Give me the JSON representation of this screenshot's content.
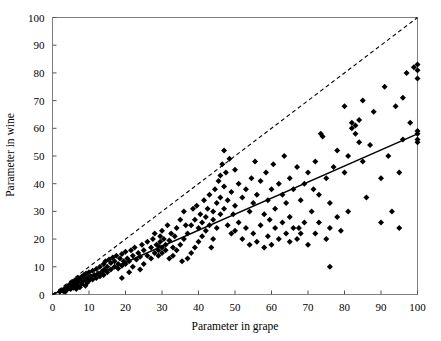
{
  "chart_data": {
    "type": "scatter",
    "title": "",
    "xlabel": "Parameter in grape",
    "ylabel": "Parameter in wine",
    "xlim": [
      0,
      100
    ],
    "ylim": [
      0,
      100
    ],
    "xticks": [
      0,
      10,
      20,
      30,
      40,
      50,
      60,
      70,
      80,
      90,
      100
    ],
    "yticks": [
      0,
      10,
      20,
      30,
      40,
      50,
      60,
      70,
      80,
      90,
      100
    ],
    "xtick_labels": [
      "0",
      "10",
      "20",
      "30",
      "40",
      "50",
      "60",
      "70",
      "80",
      "90",
      "100"
    ],
    "ytick_labels": [
      "0",
      "10",
      "20",
      "30",
      "40",
      "50",
      "60",
      "70",
      "80",
      "90",
      "100"
    ],
    "grid": false,
    "legend": "none",
    "marker": "diamond",
    "marker_color": "#000000",
    "frame_color": "#808080",
    "series": [
      {
        "name": "Observations",
        "marker": "diamond",
        "color": "#000000",
        "points": [
          [
            2.0,
            1.0
          ],
          [
            2.5,
            1.5
          ],
          [
            3.0,
            1.2
          ],
          [
            3.2,
            2.0
          ],
          [
            3.5,
            1.0
          ],
          [
            3.8,
            2.6
          ],
          [
            4.0,
            1.8
          ],
          [
            4.2,
            3.0
          ],
          [
            4.5,
            2.2
          ],
          [
            4.8,
            3.6
          ],
          [
            5.0,
            2.0
          ],
          [
            5.0,
            4.0
          ],
          [
            5.2,
            3.0
          ],
          [
            5.5,
            4.4
          ],
          [
            5.8,
            2.4
          ],
          [
            6.0,
            3.4
          ],
          [
            6.0,
            5.0
          ],
          [
            6.3,
            4.0
          ],
          [
            6.5,
            2.0
          ],
          [
            6.8,
            5.6
          ],
          [
            7.0,
            3.0
          ],
          [
            7.0,
            4.6
          ],
          [
            7.2,
            6.0
          ],
          [
            7.5,
            2.6
          ],
          [
            7.8,
            5.0
          ],
          [
            8.0,
            3.8
          ],
          [
            8.0,
            6.4
          ],
          [
            8.3,
            4.8
          ],
          [
            8.6,
            7.0
          ],
          [
            9.0,
            3.2
          ],
          [
            9.0,
            5.6
          ],
          [
            9.2,
            7.6
          ],
          [
            9.5,
            4.2
          ],
          [
            9.8,
            6.2
          ],
          [
            10.0,
            5.0
          ],
          [
            10.0,
            8.0
          ],
          [
            10.5,
            6.6
          ],
          [
            11.0,
            5.4
          ],
          [
            11.0,
            8.6
          ],
          [
            11.5,
            7.0
          ],
          [
            12.0,
            6.0
          ],
          [
            12.0,
            9.2
          ],
          [
            12.5,
            7.6
          ],
          [
            13.0,
            6.6
          ],
          [
            13.0,
            10.0
          ],
          [
            13.5,
            8.2
          ],
          [
            14.0,
            7.0
          ],
          [
            14.0,
            11.0
          ],
          [
            14.2,
            9.0
          ],
          [
            14.5,
            12.0
          ],
          [
            15.0,
            8.0
          ],
          [
            15.0,
            10.0
          ],
          [
            15.5,
            12.6
          ],
          [
            16.0,
            9.0
          ],
          [
            16.0,
            11.4
          ],
          [
            16.5,
            13.4
          ],
          [
            17.0,
            10.0
          ],
          [
            17.0,
            12.0
          ],
          [
            17.5,
            14.0
          ],
          [
            18.0,
            9.4
          ],
          [
            18.0,
            11.0
          ],
          [
            18.5,
            13.0
          ],
          [
            19.0,
            6.0
          ],
          [
            19.0,
            10.4
          ],
          [
            19.0,
            14.6
          ],
          [
            19.5,
            12.0
          ],
          [
            20.0,
            11.0
          ],
          [
            20.0,
            15.4
          ],
          [
            20.5,
            13.0
          ],
          [
            21.0,
            12.0
          ],
          [
            21.5,
            16.0
          ],
          [
            22.0,
            10.0
          ],
          [
            22.0,
            14.0
          ],
          [
            22.5,
            17.0
          ],
          [
            23.0,
            12.6
          ],
          [
            23.5,
            15.0
          ],
          [
            24.0,
            13.6
          ],
          [
            24.5,
            18.0
          ],
          [
            25.0,
            11.0
          ],
          [
            25.0,
            16.0
          ],
          [
            26.0,
            14.0
          ],
          [
            26.0,
            19.0
          ],
          [
            27.0,
            13.0
          ],
          [
            27.0,
            17.0
          ],
          [
            27.5,
            20.0
          ],
          [
            28.0,
            15.0
          ],
          [
            28.0,
            22.0
          ],
          [
            28.5,
            18.0
          ],
          [
            29.0,
            14.0
          ],
          [
            29.0,
            16.0
          ],
          [
            29.0,
            17.5
          ],
          [
            29.5,
            19.0
          ],
          [
            29.5,
            21.0
          ],
          [
            30.0,
            15.0
          ],
          [
            30.0,
            17.0
          ],
          [
            30.0,
            23.0
          ],
          [
            30.5,
            20.0
          ],
          [
            31.0,
            16.0
          ],
          [
            31.0,
            18.0
          ],
          [
            31.5,
            25.0
          ],
          [
            32.0,
            13.0
          ],
          [
            32.0,
            19.5
          ],
          [
            32.5,
            22.0
          ],
          [
            33.0,
            14.0
          ],
          [
            33.0,
            17.0
          ],
          [
            33.5,
            21.0
          ],
          [
            34.0,
            16.0
          ],
          [
            34.0,
            24.0
          ],
          [
            35.0,
            18.0
          ],
          [
            35.0,
            27.0
          ],
          [
            36.0,
            20.0
          ],
          [
            36.0,
            30.0
          ],
          [
            37.0,
            13.0
          ],
          [
            37.0,
            22.0
          ],
          [
            38.0,
            15.0
          ],
          [
            38.0,
            25.0
          ],
          [
            38.5,
            31.0
          ],
          [
            39.0,
            17.0
          ],
          [
            39.0,
            27.0
          ],
          [
            39.5,
            32.0
          ],
          [
            40.0,
            19.0
          ],
          [
            40.0,
            24.0
          ],
          [
            40.5,
            29.0
          ],
          [
            41.0,
            21.0
          ],
          [
            41.0,
            26.0
          ],
          [
            41.5,
            34.0
          ],
          [
            42.0,
            23.0
          ],
          [
            42.0,
            28.0
          ],
          [
            42.5,
            31.0
          ],
          [
            43.0,
            25.0
          ],
          [
            43.0,
            36.0
          ],
          [
            44.0,
            27.0
          ],
          [
            44.0,
            30.0
          ],
          [
            44.5,
            38.0
          ],
          [
            45.0,
            24.0
          ],
          [
            45.0,
            33.0
          ],
          [
            45.5,
            41.0
          ],
          [
            46.0,
            29.0
          ],
          [
            46.0,
            35.0
          ],
          [
            46.0,
            43.0
          ],
          [
            46.5,
            47.0
          ],
          [
            47.0,
            31.0
          ],
          [
            47.0,
            39.0
          ],
          [
            47.0,
            52.0
          ],
          [
            47.5,
            44.0
          ],
          [
            48.0,
            25.0
          ],
          [
            48.0,
            34.0
          ],
          [
            48.5,
            49.0
          ],
          [
            49.0,
            22.0
          ],
          [
            49.0,
            37.0
          ],
          [
            50.0,
            23.0
          ],
          [
            50.0,
            32.0
          ],
          [
            50.0,
            45.0
          ],
          [
            51.0,
            26.0
          ],
          [
            51.0,
            40.0
          ],
          [
            52.0,
            20.0
          ],
          [
            52.0,
            35.0
          ],
          [
            53.0,
            24.0
          ],
          [
            53.0,
            38.0
          ],
          [
            54.0,
            18.0
          ],
          [
            54.0,
            30.0
          ],
          [
            54.5,
            42.0
          ],
          [
            55.0,
            22.0
          ],
          [
            55.0,
            33.0
          ],
          [
            55.5,
            48.0
          ],
          [
            56.0,
            19.0
          ],
          [
            56.0,
            36.0
          ],
          [
            57.0,
            25.0
          ],
          [
            57.0,
            41.0
          ],
          [
            58.0,
            17.0
          ],
          [
            58.0,
            29.0
          ],
          [
            58.5,
            44.0
          ],
          [
            59.0,
            21.0
          ],
          [
            59.0,
            34.0
          ],
          [
            60.0,
            18.0
          ],
          [
            60.0,
            38.0
          ],
          [
            60.5,
            47.0
          ],
          [
            61.0,
            24.0
          ],
          [
            61.0,
            31.0
          ],
          [
            62.0,
            20.0
          ],
          [
            62.0,
            40.0
          ],
          [
            63.0,
            26.0
          ],
          [
            63.0,
            36.0
          ],
          [
            63.5,
            50.0
          ],
          [
            64.0,
            22.0
          ],
          [
            64.0,
            33.0
          ],
          [
            65.0,
            19.0
          ],
          [
            65.0,
            28.0
          ],
          [
            65.0,
            42.0
          ],
          [
            66.0,
            24.0
          ],
          [
            66.0,
            38.0
          ],
          [
            67.0,
            20.0
          ],
          [
            67.0,
            46.0
          ],
          [
            68.0,
            22.0
          ],
          [
            68.0,
            34.0
          ],
          [
            69.0,
            26.0
          ],
          [
            69.0,
            40.0
          ],
          [
            70.0,
            18.0
          ],
          [
            70.0,
            44.0
          ],
          [
            71.0,
            30.0
          ],
          [
            72.0,
            22.0
          ],
          [
            72.0,
            48.0
          ],
          [
            73.0,
            26.0
          ],
          [
            73.0,
            36.0
          ],
          [
            73.5,
            58.0
          ],
          [
            74.0,
            57.0
          ],
          [
            75.0,
            20.0
          ],
          [
            75.0,
            42.0
          ],
          [
            76.0,
            10.0
          ],
          [
            76.0,
            24.0
          ],
          [
            76.0,
            33.0
          ],
          [
            77.0,
            46.0
          ],
          [
            78.0,
            28.0
          ],
          [
            78.0,
            52.0
          ],
          [
            79.0,
            23.0
          ],
          [
            80.0,
            44.0
          ],
          [
            80.0,
            68.0
          ],
          [
            81.0,
            30.0
          ],
          [
            81.0,
            50.0
          ],
          [
            82.0,
            60.0
          ],
          [
            82.0,
            62.0
          ],
          [
            83.0,
            58.0
          ],
          [
            83.0,
            61.0
          ],
          [
            84.0,
            55.0
          ],
          [
            84.0,
            63.0
          ],
          [
            85.0,
            48.0
          ],
          [
            85.0,
            70.0
          ],
          [
            86.0,
            35.0
          ],
          [
            87.0,
            54.0
          ],
          [
            88.0,
            66.0
          ],
          [
            90.0,
            42.0
          ],
          [
            90.0,
            26.0
          ],
          [
            91.0,
            75.0
          ],
          [
            92.0,
            50.0
          ],
          [
            93.0,
            30.0
          ],
          [
            94.0,
            68.0
          ],
          [
            95.0,
            24.0
          ],
          [
            95.0,
            44.0
          ],
          [
            96.0,
            71.0
          ],
          [
            96.0,
            56.0
          ],
          [
            97.0,
            80.0
          ],
          [
            98.0,
            62.0
          ],
          [
            99.0,
            82.0
          ],
          [
            100.0,
            56.0
          ],
          [
            100.0,
            58.0
          ],
          [
            100.0,
            59.0
          ],
          [
            100.0,
            78.0
          ],
          [
            100.0,
            81.0
          ],
          [
            100.0,
            83.0
          ],
          [
            100.0,
            55.0
          ],
          [
            44.0,
            20.0
          ],
          [
            35.5,
            12.0
          ],
          [
            21.0,
            8.0
          ],
          [
            24.0,
            9.0
          ],
          [
            43.5,
            17.0
          ],
          [
            36.5,
            25.0
          ],
          [
            49.5,
            29.0
          ],
          [
            59.5,
            27.0
          ],
          [
            71.5,
            38.0
          ],
          [
            67.5,
            24.0
          ]
        ]
      }
    ],
    "lines": [
      {
        "name": "identity-line",
        "style": "dashed",
        "color": "#000000",
        "from": [
          0,
          0
        ],
        "to": [
          100,
          100
        ]
      },
      {
        "name": "regression-line",
        "style": "solid",
        "color": "#000000",
        "from": [
          0,
          0
        ],
        "to": [
          100,
          58
        ]
      }
    ]
  }
}
